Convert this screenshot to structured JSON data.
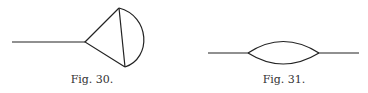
{
  "figures": [
    {
      "caption": "Fig. 30.",
      "description": "line attached to a triangle whose far side is closed by an arc"
    },
    {
      "caption": "Fig. 31.",
      "description": "line with a lens-shaped loop in the middle"
    }
  ],
  "colors": {
    "stroke": "#222222",
    "text": "#333333"
  }
}
